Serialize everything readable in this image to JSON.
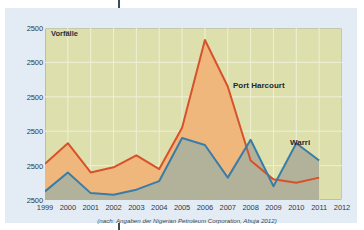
{
  "figure": {
    "y_axis_title": "Vorfälle",
    "source_caption": "(nach: Angaben der Nigerian Petroleum Corporation, Abuja 2012)",
    "series_labels": {
      "port_harcourt": "Port Harcourt",
      "warri": "Warri"
    }
  },
  "colors": {
    "page_background": "#ffffff",
    "panel_background": "#e3ecf4",
    "plot_background": "#dde0ad",
    "port_harcourt_line": "#d8512b",
    "port_harcourt_fill": "#f0b77c",
    "warri_line": "#3a7ca8",
    "warri_fill": "#b2b29b",
    "gridline": "#eef0d6",
    "axis": "#8a8f72",
    "text": "#2f3a44"
  },
  "chart_data": {
    "type": "area",
    "title": "",
    "xlabel": "",
    "ylabel": "Vorfälle",
    "grid": true,
    "legend": "inline-annotations",
    "x": [
      1999,
      2000,
      2001,
      2002,
      2003,
      2004,
      2005,
      2006,
      2007,
      2008,
      2009,
      2010,
      2011
    ],
    "x_tick_labels": [
      "1999",
      "2000",
      "2001",
      "2002",
      "2003",
      "2004",
      "2005",
      "2006",
      "2007",
      "2008",
      "2009",
      "2010",
      "2011",
      "2012"
    ],
    "y_tick_labels": [
      "2500",
      "2500",
      "2500",
      "2500",
      "2500",
      "2500"
    ],
    "ylim": [
      0,
      100
    ],
    "series": [
      {
        "name": "Port Harcourt",
        "color": "#d8512b",
        "fill": "#f0b77c",
        "values": [
          21,
          33,
          16,
          19,
          26,
          18,
          42,
          93,
          66,
          23,
          12,
          10,
          13
        ]
      },
      {
        "name": "Warri",
        "color": "#3a7ca8",
        "fill": "#b2b29b",
        "values": [
          5,
          16,
          4,
          3,
          6,
          11,
          36,
          32,
          13,
          35,
          8,
          33,
          23
        ]
      }
    ]
  }
}
